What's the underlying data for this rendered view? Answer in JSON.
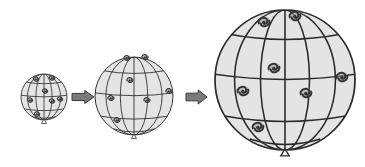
{
  "diagram": {
    "colors": {
      "balloon_fill": "#e4e4e4",
      "grid_line": "#2a2a2a",
      "galaxy": "#333333",
      "arrow_fill": "#7a7a7a",
      "arrow_stroke": "#3a3a3a"
    },
    "balloons": [
      {
        "name": "small",
        "cx": 44,
        "cy": 97,
        "r": 23,
        "galaxies": [
          [
            36,
            79
          ],
          [
            52,
            78
          ],
          [
            45,
            91
          ],
          [
            30,
            100
          ],
          [
            52,
            101
          ],
          [
            60,
            99
          ],
          [
            37,
            114
          ]
        ]
      },
      {
        "name": "medium",
        "cx": 134,
        "cy": 96,
        "r": 39,
        "galaxies": [
          [
            127,
            58
          ],
          [
            145,
            57
          ],
          [
            130,
            80
          ],
          [
            111,
            98
          ],
          [
            147,
            100
          ],
          [
            169,
            91
          ],
          [
            117,
            120
          ]
        ]
      },
      {
        "name": "large",
        "cx": 285,
        "cy": 80,
        "r": 70,
        "galaxies": [
          [
            264,
            22
          ],
          [
            295,
            16
          ],
          [
            274,
            68
          ],
          [
            342,
            77
          ],
          [
            243,
            91
          ],
          [
            306,
            93
          ],
          [
            258,
            127
          ]
        ]
      }
    ],
    "arrows": [
      {
        "name": "arrow-1",
        "x": 72,
        "y": 97,
        "w": 22,
        "h": 13
      },
      {
        "name": "arrow-2",
        "x": 186,
        "y": 97,
        "w": 21,
        "h": 14
      }
    ]
  }
}
